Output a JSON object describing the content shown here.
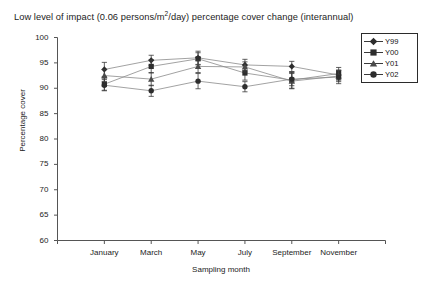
{
  "chart_data": {
    "type": "line",
    "title": "Low level of impact (0.06 persons/m2/day) percentage cover change (interannual)",
    "title_parts": {
      "before": "Low level of impact (0.06 persons/m",
      "sup": "2",
      "after": "/day) percentage cover change (interannual)"
    },
    "xlabel": "Sampling month",
    "ylabel": "Percentage cover",
    "ylim": [
      60,
      100
    ],
    "yticks": [
      100,
      95,
      90,
      85,
      80,
      75,
      70,
      65,
      60
    ],
    "ytick_labels": [
      "100",
      "95",
      "90",
      "85",
      "80",
      "75",
      "70",
      "65",
      "60"
    ],
    "categories": [
      "January",
      "March",
      "May",
      "July",
      "September",
      "November"
    ],
    "x": [
      1,
      2,
      3,
      4,
      5,
      6
    ],
    "grid": false,
    "legend_position": "upper right",
    "errorbars": true,
    "series": [
      {
        "name": "Y99",
        "marker": "diamond",
        "color": "#2d2d2d",
        "values": [
          93.7,
          95.5,
          96.0,
          94.6,
          94.3,
          92.6
        ],
        "errors": [
          1.4,
          1.0,
          1.3,
          1.1,
          1.0,
          1.0
        ]
      },
      {
        "name": "Y00",
        "marker": "square",
        "color": "#2d2d2d",
        "values": [
          90.8,
          94.3,
          95.8,
          93.0,
          91.6,
          92.9
        ],
        "errors": [
          1.2,
          1.3,
          1.2,
          1.4,
          1.6,
          1.2
        ]
      },
      {
        "name": "Y01",
        "marker": "triangle",
        "color": "#4a4a4a",
        "values": [
          92.5,
          91.8,
          94.3,
          94.2,
          91.4,
          92.4
        ],
        "errors": [
          1.2,
          1.3,
          1.2,
          1.0,
          1.5,
          1.1
        ]
      },
      {
        "name": "Y02",
        "marker": "circle",
        "color": "#2d2d2d",
        "values": [
          90.6,
          89.5,
          91.4,
          90.3,
          91.8,
          92.2
        ],
        "errors": [
          1.1,
          1.1,
          1.5,
          1.0,
          1.3,
          1.3
        ]
      }
    ]
  },
  "legend": {
    "items": [
      {
        "label": "Y99"
      },
      {
        "label": "Y00"
      },
      {
        "label": "Y01"
      },
      {
        "label": "Y02"
      }
    ]
  }
}
